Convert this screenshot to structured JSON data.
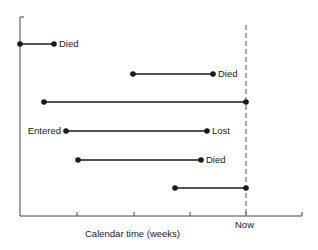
{
  "diagram": {
    "title": "",
    "xlabel": "Calendar time (weeks)",
    "now_label": "Now",
    "axis": {
      "x0": 20,
      "x1": 302,
      "y_axis_top": 17,
      "baseline": 216
    },
    "ticks_x": [
      77,
      134,
      190,
      246,
      302
    ],
    "now_x": 246,
    "line_color": "#1a1a1a",
    "dash_color": "#555555",
    "subjects": [
      {
        "id": 1,
        "y": 44,
        "start": 20,
        "end": 54,
        "start_label": "",
        "end_label": "Died"
      },
      {
        "id": 2,
        "y": 74,
        "start": 133,
        "end": 213,
        "start_label": "",
        "end_label": "Died"
      },
      {
        "id": 3,
        "y": 102,
        "start": 44,
        "end": 246,
        "start_label": "",
        "end_label": ""
      },
      {
        "id": 4,
        "y": 131,
        "start": 66,
        "end": 207,
        "start_label": "Entered",
        "end_label": "Lost"
      },
      {
        "id": 5,
        "y": 160,
        "start": 78,
        "end": 201,
        "start_label": "",
        "end_label": "Died"
      },
      {
        "id": 6,
        "y": 188,
        "start": 175,
        "end": 246,
        "start_label": "",
        "end_label": ""
      }
    ]
  }
}
